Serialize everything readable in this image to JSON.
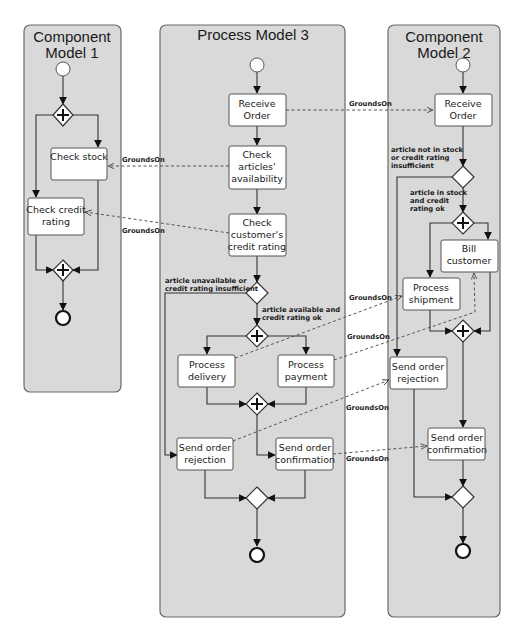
{
  "lanes": {
    "component_model_1": {
      "title_line1": "Component",
      "title_line2": "Model 1"
    },
    "process_model_3": {
      "title": "Process Model 3"
    },
    "component_model_2": {
      "title_line1": "Component",
      "title_line2": "Model 2"
    }
  },
  "cm1": {
    "check_stock": {
      "line1": "Check stock"
    },
    "check_credit": {
      "line1": "Check credit",
      "line2": "rating"
    }
  },
  "pm3": {
    "receive_order": {
      "line1": "Receive",
      "line2": "Order"
    },
    "check_articles": {
      "line1": "Check",
      "line2": "articles'",
      "line3": "availability"
    },
    "check_credit": {
      "line1": "Check",
      "line2": "customer's",
      "line3": "credit rating"
    },
    "cond_fail": {
      "line1": "article unavailable or",
      "line2": "credit rating insufficient"
    },
    "cond_ok": {
      "line1": "article available and",
      "line2": "credit rating ok"
    },
    "process_delivery": {
      "line1": "Process",
      "line2": "delivery"
    },
    "process_payment": {
      "line1": "Process",
      "line2": "payment"
    },
    "send_rejection": {
      "line1": "Send order",
      "line2": "rejection"
    },
    "send_confirmation": {
      "line1": "Send order",
      "line2": "confirmation"
    }
  },
  "cm2": {
    "receive_order": {
      "line1": "Receive",
      "line2": "Order"
    },
    "cond_fail": {
      "line1": "article not in stock",
      "line2": "or credit rating",
      "line3": "insufficient"
    },
    "cond_ok": {
      "line1": "article in stock",
      "line2": "and credit",
      "line3": "rating ok"
    },
    "bill_customer": {
      "line1": "Bill",
      "line2": "customer"
    },
    "process_shipment": {
      "line1": "Process",
      "line2": "shipment"
    },
    "send_rejection": {
      "line1": "Send order",
      "line2": "rejection"
    },
    "send_confirmation": {
      "line1": "Send order",
      "line2": "confirmation"
    }
  },
  "relations": {
    "label": "GroundsOn",
    "items": [
      {
        "from": "Receive Order (PM3)",
        "to": "Receive Order (CM2)",
        "label": "GroundsOn"
      },
      {
        "from": "Check articles' availability (PM3)",
        "to": "Check stock (CM1)",
        "label": "GroundsOn"
      },
      {
        "from": "Check customer's credit rating (PM3)",
        "to": "Check credit rating (CM1)",
        "label": "GroundsOn"
      },
      {
        "from": "Process delivery (PM3)",
        "to": "Process shipment (CM2)",
        "label": "GroundsOn"
      },
      {
        "from": "Process payment (PM3)",
        "to": "Bill customer (CM2)",
        "label": "GroundsOn"
      },
      {
        "from": "Send order rejection (PM3)",
        "to": "Send order rejection (CM2)",
        "label": "GroundsOn"
      },
      {
        "from": "Send order confirmation (PM3)",
        "to": "Send order confirmation (CM2)",
        "label": "GroundsOn"
      }
    ]
  }
}
